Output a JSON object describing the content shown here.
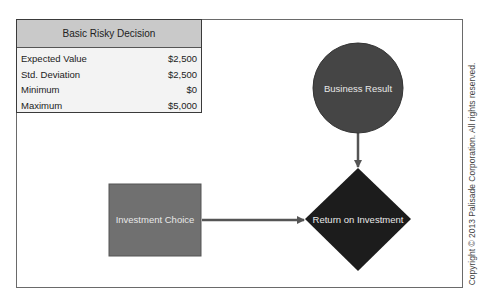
{
  "stats_table": {
    "title": "Basic Risky Decision",
    "rows": [
      {
        "label": "Expected Value",
        "value": "$2,500"
      },
      {
        "label": "Std. Deviation",
        "value": "$2,500"
      },
      {
        "label": "Minimum",
        "value": "$0"
      },
      {
        "label": "Maximum",
        "value": "$5,000"
      }
    ]
  },
  "nodes": {
    "decision": {
      "label": "Investment Choice",
      "shape": "square",
      "color": "#707070"
    },
    "chance": {
      "label": "Business Result",
      "shape": "circle",
      "color": "#454545"
    },
    "outcome": {
      "label": "Return on Investment",
      "shape": "diamond",
      "color": "#1c1c1c"
    }
  },
  "edges": [
    {
      "from": "Investment Choice",
      "to": "Return on Investment"
    },
    {
      "from": "Business Result",
      "to": "Return on Investment"
    }
  ],
  "copyright": "Copyright © 2013 Palisade Corporation. All rights reserved."
}
